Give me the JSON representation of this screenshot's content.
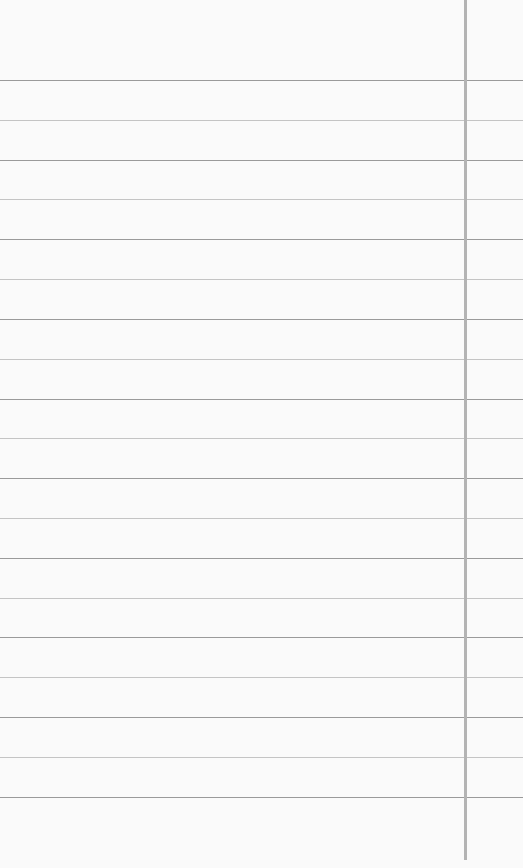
{
  "paper": {
    "background": "#fafafa",
    "rule_spacing_px": 39.8,
    "rules": [
      {
        "y": 80,
        "tone": "dark"
      },
      {
        "y": 120,
        "tone": "light"
      },
      {
        "y": 160,
        "tone": "dark"
      },
      {
        "y": 199,
        "tone": "light"
      },
      {
        "y": 239,
        "tone": "dark"
      },
      {
        "y": 279,
        "tone": "light"
      },
      {
        "y": 319,
        "tone": "dark"
      },
      {
        "y": 359,
        "tone": "light"
      },
      {
        "y": 399,
        "tone": "dark"
      },
      {
        "y": 438,
        "tone": "light"
      },
      {
        "y": 478,
        "tone": "dark"
      },
      {
        "y": 518,
        "tone": "light"
      },
      {
        "y": 558,
        "tone": "dark"
      },
      {
        "y": 598,
        "tone": "light"
      },
      {
        "y": 637,
        "tone": "dark"
      },
      {
        "y": 677,
        "tone": "light"
      },
      {
        "y": 717,
        "tone": "dark"
      },
      {
        "y": 757,
        "tone": "light"
      },
      {
        "y": 797,
        "tone": "dark"
      }
    ],
    "margin_line": {
      "x": 464,
      "top": 0,
      "bottom": 860,
      "color": "#b3b3b3"
    }
  }
}
